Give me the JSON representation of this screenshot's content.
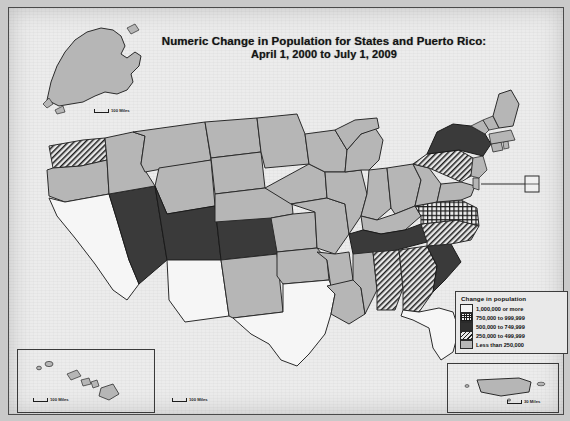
{
  "title": {
    "line1": "Numeric Change in Population for States and Puerto Rico:",
    "line2": "April 1, 2000 to July 1, 2009"
  },
  "legend": {
    "heading": "Change in population",
    "entries": [
      {
        "label": "1,000,000 or more",
        "pattern": "white",
        "color": "#f4f4f4"
      },
      {
        "label": "750,000 to 999,999",
        "pattern": "crosshatch",
        "color": "#1a1a1a"
      },
      {
        "label": "500,000 to 749,999",
        "pattern": "solid-dark",
        "color": "#2f2f2f"
      },
      {
        "label": "250,000 to 499,999",
        "pattern": "diagonal",
        "color": "#1e1e1e"
      },
      {
        "label": "Less than 250,000",
        "pattern": "light-gray",
        "color": "#b6b6b6"
      }
    ]
  },
  "scale_bars": {
    "alaska": "100 Miles",
    "main": "100 Miles",
    "hawaii": "100 Miles",
    "puerto_rico": "30 Miles"
  },
  "insets": {
    "alaska_name": "Alaska",
    "hawaii_name": "Hawaii",
    "puerto_rico_name": "Puerto Rico"
  },
  "map_data": {
    "type": "choropleth",
    "regions": [
      {
        "state": "Alaska",
        "class": "light-gray"
      },
      {
        "state": "Hawaii",
        "class": "light-gray"
      },
      {
        "state": "Washington",
        "class": "diagonal"
      },
      {
        "state": "Oregon",
        "class": "light-gray"
      },
      {
        "state": "California",
        "class": "white"
      },
      {
        "state": "Nevada",
        "class": "solid-dark"
      },
      {
        "state": "Idaho",
        "class": "light-gray"
      },
      {
        "state": "Montana",
        "class": "light-gray"
      },
      {
        "state": "Wyoming",
        "class": "light-gray"
      },
      {
        "state": "Utah",
        "class": "solid-dark"
      },
      {
        "state": "Colorado",
        "class": "solid-dark"
      },
      {
        "state": "Arizona",
        "class": "white"
      },
      {
        "state": "New Mexico",
        "class": "light-gray"
      },
      {
        "state": "North Dakota",
        "class": "light-gray"
      },
      {
        "state": "South Dakota",
        "class": "light-gray"
      },
      {
        "state": "Nebraska",
        "class": "light-gray"
      },
      {
        "state": "Kansas",
        "class": "light-gray"
      },
      {
        "state": "Oklahoma",
        "class": "light-gray"
      },
      {
        "state": "Texas",
        "class": "white"
      },
      {
        "state": "Minnesota",
        "class": "light-gray"
      },
      {
        "state": "Iowa",
        "class": "light-gray"
      },
      {
        "state": "Missouri",
        "class": "light-gray"
      },
      {
        "state": "Arkansas",
        "class": "light-gray"
      },
      {
        "state": "Louisiana",
        "class": "light-gray"
      },
      {
        "state": "Wisconsin",
        "class": "light-gray"
      },
      {
        "state": "Illinois",
        "class": "light-gray"
      },
      {
        "state": "Michigan",
        "class": "light-gray"
      },
      {
        "state": "Indiana",
        "class": "light-gray"
      },
      {
        "state": "Ohio",
        "class": "light-gray"
      },
      {
        "state": "Kentucky",
        "class": "light-gray"
      },
      {
        "state": "Tennessee",
        "class": "solid-dark"
      },
      {
        "state": "Mississippi",
        "class": "light-gray"
      },
      {
        "state": "Alabama",
        "class": "diagonal"
      },
      {
        "state": "Georgia",
        "class": "diagonal"
      },
      {
        "state": "Florida",
        "class": "white"
      },
      {
        "state": "South Carolina",
        "class": "solid-dark"
      },
      {
        "state": "North Carolina",
        "class": "diagonal"
      },
      {
        "state": "Virginia",
        "class": "crosshatch"
      },
      {
        "state": "West Virginia",
        "class": "light-gray"
      },
      {
        "state": "Maryland",
        "class": "light-gray"
      },
      {
        "state": "Delaware",
        "class": "light-gray"
      },
      {
        "state": "Pennsylvania",
        "class": "diagonal"
      },
      {
        "state": "New Jersey",
        "class": "light-gray"
      },
      {
        "state": "New York",
        "class": "solid-dark"
      },
      {
        "state": "Connecticut",
        "class": "light-gray"
      },
      {
        "state": "Rhode Island",
        "class": "light-gray"
      },
      {
        "state": "Massachusetts",
        "class": "light-gray"
      },
      {
        "state": "Vermont",
        "class": "light-gray"
      },
      {
        "state": "New Hampshire",
        "class": "light-gray"
      },
      {
        "state": "Maine",
        "class": "light-gray"
      },
      {
        "state": "Puerto Rico",
        "class": "light-gray"
      }
    ]
  }
}
